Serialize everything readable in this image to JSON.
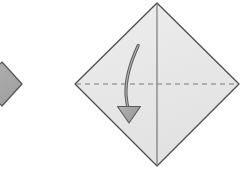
{
  "figure": {
    "kind": "origami-fold-step-diagram",
    "canvas": {
      "width": 245,
      "height": 169,
      "background": "#ffffff"
    },
    "caption": ""
  },
  "colors": {
    "background": "#ffffff",
    "previous_shape_fill": "#a9a9a9",
    "previous_shape_stroke": "#555555",
    "main_shape_fill": "#e8e8e8",
    "main_shape_stroke": "#4d4d4d",
    "crease_line": "#6e6e6e",
    "fold_line_dashed": "#7a7a7a",
    "arrow_fill": "#a6a6a6",
    "arrow_stroke": "#5a5a5a"
  },
  "shapes": {
    "previous_step": {
      "label": "previous step partial diamond",
      "points": "-20,84 2,62 22,84 2,106",
      "fill": "#a9a9a9",
      "stroke": "#555555",
      "stroke_width": 1.2,
      "clipped_at_left_edge": true
    },
    "main_diamond": {
      "label": "folded paper diamond",
      "points": "157,3 239,84 157,166 75,84",
      "fill": "#e8e8e8",
      "stroke": "#4d4d4d",
      "stroke_width": 1.3,
      "corners": {
        "top": [
          157,
          3
        ],
        "right": [
          239,
          84
        ],
        "bottom": [
          157,
          166
        ],
        "left": [
          75,
          84
        ]
      }
    }
  },
  "guides": {
    "vertical_crease": {
      "label": "vertical center crease",
      "style": "solid",
      "x1": 157,
      "y1": 3,
      "x2": 157,
      "y2": 166,
      "stroke": "#6e6e6e",
      "stroke_width": 1.1
    },
    "horizontal_fold": {
      "label": "horizontal valley fold line",
      "style": "dashed",
      "x1": 76,
      "y1": 84,
      "x2": 238,
      "y2": 84,
      "stroke": "#7a7a7a",
      "stroke_width": 1.2,
      "dash_pattern": "5,4"
    }
  },
  "arrow": {
    "label": "fold direction arrow",
    "type": "curved-fold-arrow",
    "direction": "downward",
    "tail_point": [
      138,
      45
    ],
    "tip_point": [
      129,
      123
    ],
    "curve_path": "M 138.2 45.5 C 130.5 62.0 125.2 78.0 126.0 95.0 C 126.6 102.5 127.6 107.0 128.6 111.0",
    "head_points": "129,123 117.5,106.5 140.5,106.5",
    "fill": "#a6a6a6",
    "stroke": "#5a5a5a",
    "stroke_width": 1.1
  }
}
